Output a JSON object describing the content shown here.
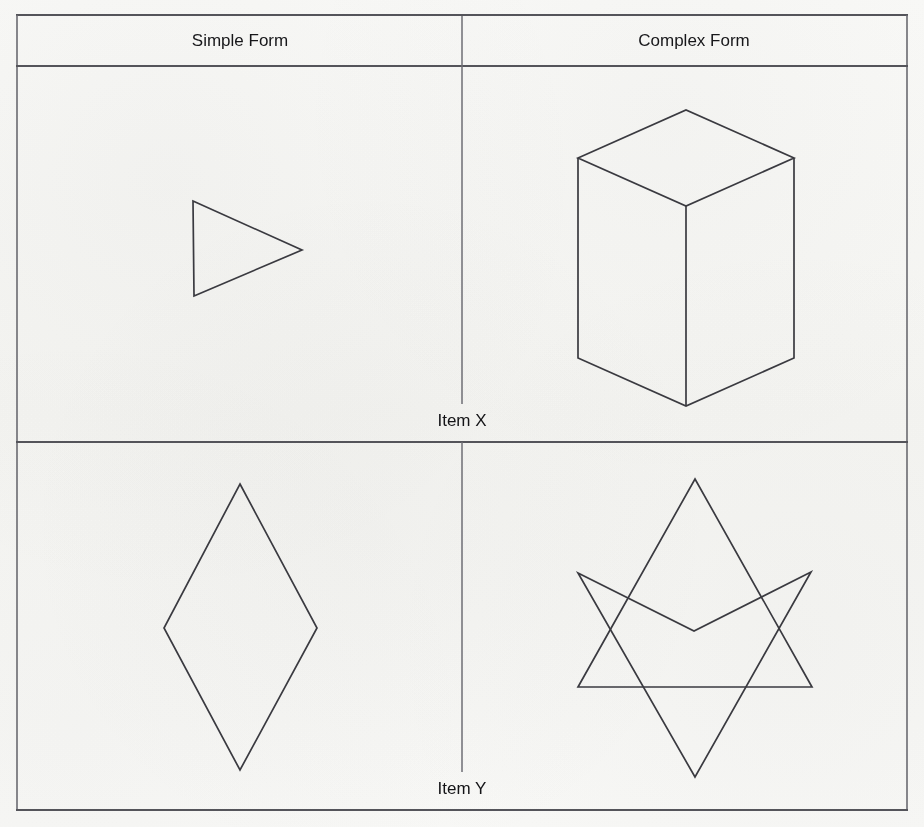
{
  "figure": {
    "background_color": "#fbfbfa",
    "line_color": "#54545a",
    "shape_stroke_color": "#3a3a40",
    "table": {
      "left": 16,
      "right": 908,
      "top": 14,
      "bottom": 810,
      "header_rule_y": 66,
      "mid_rule_y": 442,
      "column_divider_x": 462
    },
    "columns": [
      {
        "id": "simple",
        "label": "Simple Form",
        "center_x": 240
      },
      {
        "id": "complex",
        "label": "Complex Form",
        "center_x": 694
      }
    ],
    "rows": [
      {
        "id": "item-x",
        "label": "Item X",
        "label_center_x": 462,
        "label_center_y": 422
      },
      {
        "id": "item-y",
        "label": "Item Y",
        "label_center_y": 790
      }
    ],
    "shapes": [
      {
        "id": "simple-form-item-x",
        "name": "right-pointing-triangle",
        "row": "Item X",
        "column": "Simple Form",
        "closed": true,
        "points": "193,201 302,250 194,296"
      },
      {
        "id": "complex-form-item-x",
        "name": "rectangular-prism-box",
        "row": "Item X",
        "column": "Complex Form",
        "closed": false,
        "paths": [
          "M 578,158 L 686,110 L 794,158 L 686,206 Z",
          "M 578,158 L 578,358 L 686,406 L 794,358 L 794,158",
          "M 686,206 L 686,406"
        ]
      },
      {
        "id": "simple-form-item-y",
        "name": "rhombus-diamond",
        "row": "Item Y",
        "column": "Simple Form",
        "closed": true,
        "points": "240,484 317,628 240,770 164,628"
      },
      {
        "id": "complex-form-item-y",
        "name": "overlapping-triangles-star",
        "row": "Item Y",
        "column": "Complex Form",
        "closed": true,
        "parts": [
          {
            "name": "upward-triangle",
            "points": "695,479 812,687 578,687"
          },
          {
            "name": "concave-arrow-quadrilateral",
            "points": "578,573 694,631 811,572 695,777"
          }
        ]
      }
    ]
  }
}
